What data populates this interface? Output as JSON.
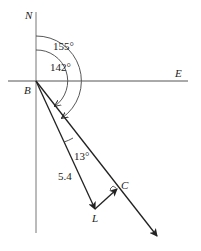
{
  "diagram": {
    "type": "bearing-vector-diagram",
    "axes": {
      "north_label": "N",
      "east_label": "E",
      "origin_label": "B"
    },
    "angles": {
      "outer_bearing": "155°",
      "inner_bearing": "142°",
      "between_angle": "13°"
    },
    "points": {
      "L": "L",
      "C": "C"
    },
    "segments": {
      "BL_length": "5.4"
    },
    "colors": {
      "line": "#222222",
      "axis": "#666666",
      "background": "#ffffff"
    }
  }
}
